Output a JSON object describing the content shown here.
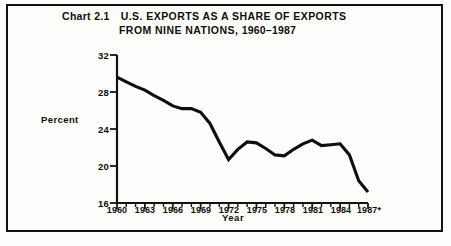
{
  "chart_header": {
    "chart_number": "Chart 2.1",
    "title_line1": "U.S. EXPORTS AS A SHARE OF EXPORTS",
    "title_line2_text": "FROM NINE NATIONS,",
    "title_line2_years": "1960–1987"
  },
  "axis": {
    "ylabel": "Percent",
    "xlabel": "Year",
    "yticks": [
      "16",
      "20",
      "24",
      "28",
      "32"
    ],
    "xticks": [
      "1960",
      "1963",
      "1966",
      "1969",
      "1972",
      "1975",
      "1978",
      "1981",
      "1984",
      "1987*"
    ]
  },
  "footnote": {
    "source": ""
  },
  "style": {
    "line_color": "#100e0b",
    "axis_color": "#15130f",
    "background": "#fdfdfb"
  },
  "chart_data": {
    "type": "line",
    "xlabel": "Year",
    "ylabel": "Percent",
    "xlim": [
      1960,
      1987
    ],
    "ylim": [
      16,
      32
    ],
    "ytick_values": [
      16,
      20,
      24,
      28,
      32
    ],
    "xtick_values": [
      1960,
      1963,
      1966,
      1969,
      1972,
      1975,
      1978,
      1981,
      1984,
      1987
    ],
    "xtick_labels": [
      "1960",
      "1963",
      "1966",
      "1969",
      "1972",
      "1975",
      "1978",
      "1981",
      "1984",
      "1987*"
    ],
    "grid": false,
    "legend": false,
    "minor_xticks_every": 1,
    "series": [
      {
        "name": "U.S. share of exports from nine nations",
        "x": [
          1960,
          1961,
          1962,
          1963,
          1964,
          1965,
          1966,
          1967,
          1968,
          1969,
          1970,
          1971,
          1972,
          1973,
          1974,
          1975,
          1976,
          1977,
          1978,
          1979,
          1980,
          1981,
          1982,
          1983,
          1984,
          1985,
          1986,
          1987
        ],
        "values": [
          29.6,
          29.1,
          28.6,
          28.2,
          27.6,
          27.1,
          26.5,
          26.2,
          26.2,
          25.8,
          24.6,
          22.6,
          20.7,
          21.8,
          22.6,
          22.5,
          21.9,
          21.2,
          21.1,
          21.8,
          22.4,
          22.8,
          22.2,
          22.3,
          22.4,
          21.2,
          18.4,
          17.2
        ]
      }
    ]
  }
}
